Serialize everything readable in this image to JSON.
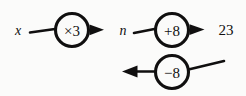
{
  "diagram": {
    "type": "function-machine-flow",
    "background_color": "#fbfbfa",
    "ink_color": "#100f0f",
    "top_row": {
      "input_label": "x",
      "operation_label": "×3",
      "intermediate_label": "n",
      "second_operation_label": "+8",
      "output_label": "23"
    },
    "bottom_row": {
      "inverse_operation_label": "−8"
    }
  }
}
